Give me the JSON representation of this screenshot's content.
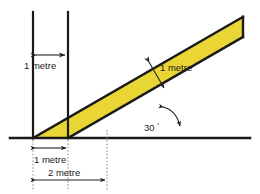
{
  "figure": {
    "background_color": "#ffffff",
    "band_fill_color": "#e9d534",
    "line_color": "#1a1a1a",
    "dimension_line_color": "#333333",
    "dotted_line_color": "#8a8a8a"
  },
  "labels": {
    "top_gap": "1 metre",
    "band_width": "1 metre",
    "base_inner": "1 metre",
    "base_outer": "2 metre",
    "angle_value": "30",
    "angle_unit": "°"
  },
  "geometry": {
    "baseline_y": 138,
    "baseline_x_start": 10,
    "baseline_x_end": 250,
    "vertical_left_x": 33,
    "vertical_right_x": 68,
    "vertical_top_y": 12,
    "angle_degrees": 30,
    "band_upper_origin_x": 33,
    "band_lower_origin_x": 68,
    "band_right_edge_x": 243
  },
  "icons": {
    "arrow_double_top": "double-headed-arrow-icon",
    "arrow_double_band": "double-headed-arrow-icon",
    "arrow_double_base_inner": "double-headed-arrow-icon",
    "arrow_double_base_outer": "double-headed-arrow-icon",
    "arrow_angle": "curved-double-headed-arrow-icon"
  }
}
